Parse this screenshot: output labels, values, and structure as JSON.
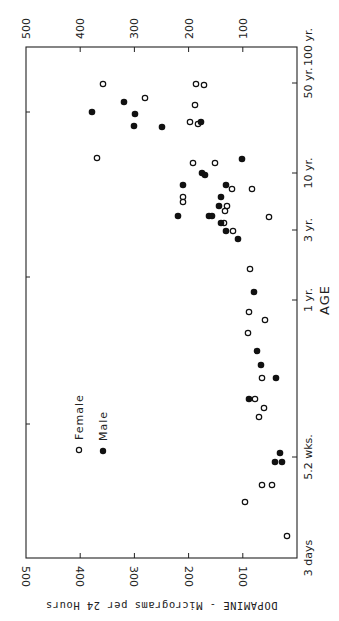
{
  "chart_data": {
    "type": "scatter",
    "orientation": "rotated-90-clockwise",
    "title": "",
    "xlabel": "AGE",
    "ylabel": "DOPAMINE - Micrograms per 24 Hours",
    "x_scale": "log",
    "x_ticks": [
      {
        "label": "3 days",
        "years": 0.0082
      },
      {
        "label": "5.2 wks.",
        "years": 0.1
      },
      {
        "label": "1 yr.",
        "years": 1
      },
      {
        "label": "3 yr.",
        "years": 3
      },
      {
        "label": "10 yr.",
        "years": 10
      },
      {
        "label": "50 yr.",
        "years": 50
      },
      {
        "label": "100 yr.",
        "years": 100
      }
    ],
    "y_ticks": [
      "100",
      "200",
      "300",
      "400",
      "500"
    ],
    "ylim": [
      0,
      500
    ],
    "grid": false,
    "legend": {
      "position": "inside-lower-left",
      "entries": [
        "Female",
        "Male"
      ]
    },
    "series": [
      {
        "name": "Female",
        "marker": "open-circle",
        "points": [
          {
            "age_years": 50,
            "dopamine": 357
          },
          {
            "age_years": 50,
            "dopamine": 186
          },
          {
            "age_years": 48,
            "dopamine": 171
          },
          {
            "age_years": 33,
            "dopamine": 281
          },
          {
            "age_years": 28,
            "dopamine": 189
          },
          {
            "age_years": 20,
            "dopamine": 197
          },
          {
            "age_years": 19,
            "dopamine": 182
          },
          {
            "age_years": 12.5,
            "dopamine": 366
          },
          {
            "age_years": 12,
            "dopamine": 191
          },
          {
            "age_years": 12,
            "dopamine": 151
          },
          {
            "age_years": 8.5,
            "dopamine": 120
          },
          {
            "age_years": 7.5,
            "dopamine": 83
          },
          {
            "age_years": 6.6,
            "dopamine": 209
          },
          {
            "age_years": 6.3,
            "dopamine": 209
          },
          {
            "age_years": 5.5,
            "dopamine": 129
          },
          {
            "age_years": 5,
            "dopamine": 135
          },
          {
            "age_years": 4.6,
            "dopamine": 52
          },
          {
            "age_years": 4.1,
            "dopamine": 135
          },
          {
            "age_years": 3.5,
            "dopamine": 118
          },
          {
            "age_years": 1.9,
            "dopamine": 87
          },
          {
            "age_years": 1.2,
            "dopamine": 89
          },
          {
            "age_years": 1.0,
            "dopamine": 59
          },
          {
            "age_years": 0.77,
            "dopamine": 90
          },
          {
            "age_years": 0.35,
            "dopamine": 65
          },
          {
            "age_years": 0.2,
            "dopamine": 77
          },
          {
            "age_years": 0.17,
            "dopamine": 61
          },
          {
            "age_years": 0.15,
            "dopamine": 70
          },
          {
            "age_years": 0.045,
            "dopamine": 65
          },
          {
            "age_years": 0.045,
            "dopamine": 46
          },
          {
            "age_years": 0.03,
            "dopamine": 95
          },
          {
            "age_years": 0.013,
            "dopamine": 19
          }
        ]
      },
      {
        "name": "Male",
        "marker": "filled-circle",
        "points": [
          {
            "age_years": 37,
            "dopamine": 319
          },
          {
            "age_years": 30,
            "dopamine": 378
          },
          {
            "age_years": 28,
            "dopamine": 299
          },
          {
            "age_years": 20,
            "dopamine": 177
          },
          {
            "age_years": 19,
            "dopamine": 301
          },
          {
            "age_years": 19,
            "dopamine": 250
          },
          {
            "age_years": 12.5,
            "dopamine": 101
          },
          {
            "age_years": 10.5,
            "dopamine": 175
          },
          {
            "age_years": 10,
            "dopamine": 170
          },
          {
            "age_years": 8.2,
            "dopamine": 210
          },
          {
            "age_years": 8.2,
            "dopamine": 131
          },
          {
            "age_years": 6.1,
            "dopamine": 140
          },
          {
            "age_years": 5,
            "dopamine": 144
          },
          {
            "age_years": 4.6,
            "dopamine": 219
          },
          {
            "age_years": 4.6,
            "dopamine": 162
          },
          {
            "age_years": 4.6,
            "dopamine": 157
          },
          {
            "age_years": 4.1,
            "dopamine": 140
          },
          {
            "age_years": 3.5,
            "dopamine": 131
          },
          {
            "age_years": 3.0,
            "dopamine": 109
          },
          {
            "age_years": 1.45,
            "dopamine": 80
          },
          {
            "age_years": 0.6,
            "dopamine": 74
          },
          {
            "age_years": 0.43,
            "dopamine": 66
          },
          {
            "age_years": 0.35,
            "dopamine": 39
          },
          {
            "age_years": 0.22,
            "dopamine": 88
          },
          {
            "age_years": 0.09,
            "dopamine": 31
          },
          {
            "age_years": 0.075,
            "dopamine": 40
          },
          {
            "age_years": 0.075,
            "dopamine": 27
          }
        ]
      }
    ]
  },
  "render": {
    "frame": {
      "left": 26,
      "right": 297,
      "top": 47,
      "bottom": 558
    },
    "dopamine_px": {
      "zero_x": 297,
      "px_per_100": 54.2
    },
    "age_ticks_px": [
      {
        "label": "3 days",
        "y": 558
      },
      {
        "label": "5.2 wks.",
        "y": 457
      },
      {
        "label": "1 yr.",
        "y": 300
      },
      {
        "label": "3 yr.",
        "y": 230
      },
      {
        "label": "10 yr.",
        "y": 173
      },
      {
        "label": "50 yr.",
        "y": 83
      },
      {
        "label": "100 yr.",
        "y": 47
      }
    ],
    "dopamine_tick_labels": [
      "100",
      "200",
      "300",
      "400",
      "500"
    ],
    "legend": {
      "female_label": "Female",
      "male_label": "Male"
    },
    "axis_titles": {
      "age": "AGE",
      "dopamine": "DOPAMINE - Micrograms per 24 Hours"
    },
    "points_px": {
      "female": [
        [
          103,
          84
        ],
        [
          196,
          84
        ],
        [
          204,
          85
        ],
        [
          145,
          98
        ],
        [
          195,
          105
        ],
        [
          190,
          122
        ],
        [
          198,
          124
        ],
        [
          97,
          158
        ],
        [
          193,
          163
        ],
        [
          215,
          163
        ],
        [
          232,
          189
        ],
        [
          252,
          189
        ],
        [
          183,
          197
        ],
        [
          183,
          202
        ],
        [
          227,
          206
        ],
        [
          225,
          211
        ],
        [
          269,
          217
        ],
        [
          224,
          223
        ],
        [
          233,
          231
        ],
        [
          250,
          269
        ],
        [
          249,
          312
        ],
        [
          265,
          320
        ],
        [
          248,
          333
        ],
        [
          262,
          378
        ],
        [
          255,
          399
        ],
        [
          264,
          408
        ],
        [
          259,
          417
        ],
        [
          262,
          485
        ],
        [
          272,
          485
        ],
        [
          245,
          502
        ],
        [
          287,
          536
        ]
      ],
      "male": [
        [
          124,
          102
        ],
        [
          92,
          112
        ],
        [
          135,
          114
        ],
        [
          201,
          122
        ],
        [
          134,
          126
        ],
        [
          162,
          127
        ],
        [
          242,
          159
        ],
        [
          202,
          173
        ],
        [
          205,
          175
        ],
        [
          183,
          185
        ],
        [
          226,
          185
        ],
        [
          221,
          197
        ],
        [
          219,
          206
        ],
        [
          178,
          216
        ],
        [
          209,
          216
        ],
        [
          212,
          216
        ],
        [
          221,
          223
        ],
        [
          226,
          231
        ],
        [
          238,
          239
        ],
        [
          254,
          292
        ],
        [
          257,
          351
        ],
        [
          261,
          365
        ],
        [
          276,
          378
        ],
        [
          249,
          399
        ],
        [
          280,
          453
        ],
        [
          275,
          462
        ],
        [
          282,
          462
        ]
      ]
    },
    "legend_px": {
      "female": [
        79,
        450
      ],
      "male": [
        103,
        451
      ]
    }
  }
}
